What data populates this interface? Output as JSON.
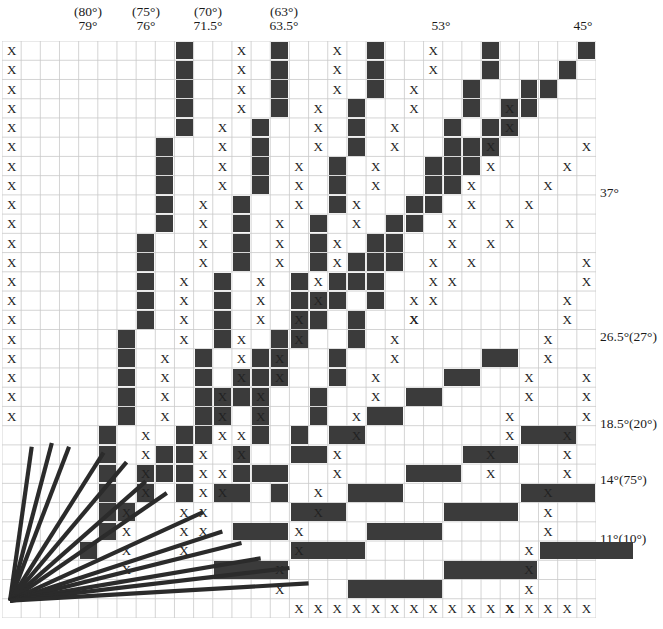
{
  "figure": {
    "grid": {
      "columns": 31,
      "rows": 30,
      "cell_width": 19.16,
      "cell_height": 19.23,
      "left": 2,
      "top": 41,
      "line_color": "#c9c9c9",
      "fill_color": "#3b3b3b",
      "ray_color": "#2b2b2b",
      "origin_col": 0.42,
      "origin_row": 29.1
    },
    "top_labels": [
      {
        "paren": "(80°)",
        "main": "79°",
        "x": 88,
        "col": 4.55
      },
      {
        "paren": "(75°)",
        "main": "76°",
        "x": 146,
        "col": 7.6
      },
      {
        "paren": "(70°)",
        "main": "71.5°",
        "x": 208,
        "col": 10.7
      },
      {
        "paren": "(63°)",
        "main": "63.5°",
        "x": 284,
        "col": 14.7
      },
      {
        "paren": "",
        "main": "53°",
        "x": 441,
        "col": 22.9
      },
      {
        "paren": "",
        "main": "45°",
        "x": 583,
        "col": 30.3
      }
    ],
    "right_labels": [
      {
        "text": "37°",
        "y": 186,
        "row": 7.6
      },
      {
        "text": "26.5°(27°)",
        "y": 330,
        "row": 15.1
      },
      {
        "text": "18.5°(20°)",
        "y": 417,
        "row": 19.6
      },
      {
        "text": "14°(75°)",
        "y": 473,
        "row": 22.5
      },
      {
        "text": "11°(10°)",
        "y": 532,
        "row": 25.6
      }
    ],
    "rays": [
      {
        "name": "ray-79",
        "angle": 79,
        "end_col": 1.55,
        "end_row": 21.1
      },
      {
        "name": "ray-76",
        "angle": 76,
        "end_col": 2.6,
        "end_row": 20.9
      },
      {
        "name": "ray-71-5",
        "angle": 71.5,
        "end_col": 3.5,
        "end_row": 21.1
      },
      {
        "name": "ray-63-5",
        "angle": 63.5,
        "end_col": 5.3,
        "end_row": 21.4
      },
      {
        "name": "ray-56",
        "angle": 56,
        "end_col": 6.5,
        "end_row": 21.9
      },
      {
        "name": "ray-53",
        "angle": 53,
        "end_col": 7.5,
        "end_row": 22.9
      },
      {
        "name": "ray-45",
        "angle": 45,
        "end_col": 8.6,
        "end_row": 23.5
      },
      {
        "name": "ray-37",
        "angle": 37,
        "end_col": 10.5,
        "end_row": 24.5
      },
      {
        "name": "ray-30",
        "angle": 30,
        "end_col": 11.5,
        "end_row": 25.5
      },
      {
        "name": "ray-26-5",
        "angle": 26.5,
        "end_col": 12.5,
        "end_row": 26.1
      },
      {
        "name": "ray-18-5",
        "angle": 18.5,
        "end_col": 13.5,
        "end_row": 26.9
      },
      {
        "name": "ray-14",
        "angle": 14,
        "end_col": 15.0,
        "end_row": 27.4
      },
      {
        "name": "ray-11",
        "angle": 11,
        "end_col": 16.0,
        "end_row": 28.2
      }
    ],
    "fill_runs": [
      {
        "name": "run-79",
        "start_col": 9,
        "start_row": 0,
        "dx": -1,
        "run": 5,
        "count": 5
      },
      {
        "name": "run-76",
        "start_col": 14,
        "start_row": 0,
        "dx": -1,
        "run": 4,
        "count": 6
      },
      {
        "name": "run-71-5",
        "start_col": 19,
        "start_row": 0,
        "dx": -1,
        "run": 3,
        "count": 8
      },
      {
        "name": "run-63-5",
        "start_col": 25,
        "start_row": 0,
        "dx": -1,
        "run": 2,
        "count": 12
      },
      {
        "name": "run-53",
        "start_col": 27,
        "start_row": 2,
        "dx": -1,
        "run": 1.33,
        "count": 21
      },
      {
        "name": "run-45",
        "start_col": 30,
        "start_row": 0,
        "dx": -1,
        "run": 1,
        "count": 27
      }
    ],
    "x_runs": [
      {
        "name": "xrun-left-col",
        "start_col": 0,
        "start_row": 0,
        "dx": 0,
        "run": 1,
        "count": 20
      },
      {
        "name": "xrun-bottom",
        "start_col": 15,
        "start_row": 29,
        "dx": 1,
        "run": 0,
        "count": 19
      },
      {
        "name": "xrun-a",
        "start_col": 12,
        "start_row": 0,
        "dx": -1,
        "run": 3.5,
        "count": 7
      },
      {
        "name": "xrun-b",
        "start_col": 17,
        "start_row": 0,
        "dx": -1,
        "run": 2.5,
        "count": 9
      },
      {
        "name": "xrun-c",
        "start_col": 22,
        "start_row": 0,
        "dx": -1,
        "run": 1.8,
        "count": 13
      },
      {
        "name": "xrun-d",
        "start_col": 26,
        "start_row": 3,
        "dx": -1,
        "run": 1.5,
        "count": 13
      },
      {
        "name": "xrun-e",
        "start_col": 30,
        "start_row": 5,
        "dx": -1,
        "run": 1.15,
        "count": 10
      },
      {
        "name": "xrun-f",
        "start_col": 30,
        "start_row": 11,
        "dx": -1,
        "run": 2.0,
        "count": 6
      },
      {
        "name": "xrun-g",
        "start_col": 30,
        "start_row": 17,
        "dx": -1,
        "run": 3.0,
        "count": 5
      }
    ]
  }
}
